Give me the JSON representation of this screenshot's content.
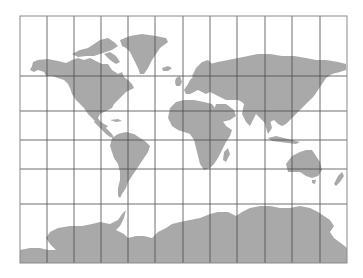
{
  "map": {
    "type": "world-map",
    "projection": "Miller-like cylindrical",
    "colors": {
      "background": "#ffffff",
      "land": "#a9a9a9",
      "graticule": "#4a4a4a",
      "frame": "#8a8a8a"
    },
    "frame": {
      "left": 20,
      "top": 16,
      "right": 347,
      "bottom": 263
    },
    "graticule": {
      "meridian_spacing_deg": 30,
      "meridian_x": [
        20,
        47,
        74,
        101,
        128,
        155,
        183,
        210,
        237,
        265,
        292,
        320,
        347
      ],
      "parallel_y": [
        16,
        76,
        111,
        140,
        169,
        204,
        263
      ]
    },
    "landmasses": [
      "North America",
      "Greenland",
      "South America",
      "Europe",
      "Africa",
      "Asia",
      "Australia",
      "Antarctica",
      "New Zealand",
      "Japan",
      "Madagascar",
      "British Isles",
      "Iceland"
    ]
  }
}
